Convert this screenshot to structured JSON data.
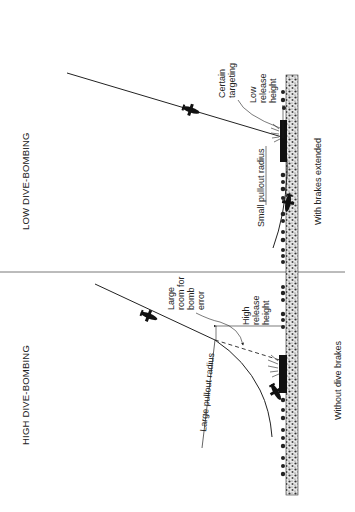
{
  "panels": [
    {
      "title": "LOW DIVE-BOMBING",
      "caption": "With brakes extended",
      "labels": {
        "pullout": "Small pullout radius",
        "targeting_1": "Certain",
        "targeting_2": "targeting",
        "release_1": "Low",
        "release_2": "release",
        "release_3": "height"
      }
    },
    {
      "title": "HIGH DIVE-BOMBING",
      "caption": "Without dive brakes",
      "labels": {
        "pullout": "Large pullout radius",
        "error_1": "Large",
        "error_2": "room for",
        "error_3": "bomb",
        "error_4": "error",
        "release_1": "High",
        "release_2": "release",
        "release_3": "height"
      }
    }
  ],
  "colors": {
    "ink": "#222222",
    "ground": "#555555",
    "background": "#ffffff"
  }
}
